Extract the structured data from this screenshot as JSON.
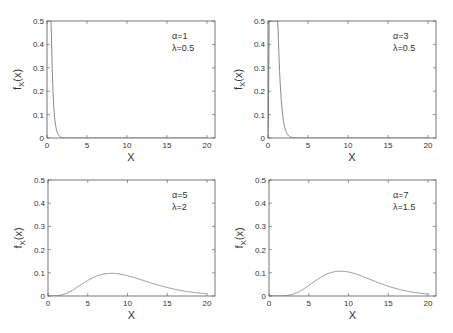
{
  "chart_data": [
    {
      "type": "line",
      "title": "",
      "xlabel": "X",
      "ylabel": "f_X(x)",
      "xlim": [
        0,
        21
      ],
      "ylim": [
        0,
        0.5
      ],
      "xticks": [
        0,
        5,
        10,
        15,
        20
      ],
      "yticks": [
        0,
        0.1,
        0.2,
        0.3,
        0.4,
        0.5
      ],
      "ytick_labels": [
        "0",
        "0.1",
        "0.2",
        "0.3",
        "0.4",
        "0.5"
      ],
      "grid": false,
      "annotation": [
        "α=1",
        "λ=0.5"
      ],
      "params": {
        "alpha": 1,
        "lambda": 0.5
      },
      "series": [
        {
          "name": "pdf",
          "x": [
            0.5,
            0.75,
            1,
            1.5,
            2,
            2.5,
            3,
            3.5,
            4,
            5,
            10,
            20
          ],
          "values": [
            0.5,
            0.37,
            0.25,
            0.12,
            0.06,
            0.03,
            0.012,
            0.005,
            0.002,
            0.0,
            0.0,
            0.0
          ]
        }
      ]
    },
    {
      "type": "line",
      "title": "",
      "xlabel": "X",
      "ylabel": "f_X(x)",
      "xlim": [
        0,
        21
      ],
      "ylim": [
        0,
        0.5
      ],
      "xticks": [
        0,
        5,
        10,
        15,
        20
      ],
      "yticks": [
        0,
        0.1,
        0.2,
        0.3,
        0.4,
        0.5
      ],
      "ytick_labels": [
        "0",
        "0.1",
        "0.2",
        "0.3",
        "0.4",
        "0.5"
      ],
      "grid": false,
      "annotation": [
        "α=3",
        "λ=0.5"
      ],
      "params": {
        "alpha": 3,
        "lambda": 0.5
      },
      "series": [
        {
          "name": "pdf",
          "x": [
            0,
            0.1,
            0.3,
            0.5,
            1.4,
            2,
            2.5,
            3,
            3.5,
            4,
            4.5,
            5,
            6,
            10,
            20
          ],
          "values": [
            0,
            0.2,
            0.5,
            0.5,
            0.5,
            0.33,
            0.22,
            0.14,
            0.08,
            0.045,
            0.022,
            0.01,
            0.0,
            0.0,
            0.0
          ]
        }
      ]
    },
    {
      "type": "line",
      "title": "",
      "xlabel": "X",
      "ylabel": "f_X(x)",
      "xlim": [
        0,
        21
      ],
      "ylim": [
        0,
        0.5
      ],
      "xticks": [
        0,
        5,
        10,
        15,
        20
      ],
      "yticks": [
        0,
        0.1,
        0.2,
        0.3,
        0.4,
        0.5
      ],
      "ytick_labels": [
        "0",
        "0.1",
        "0.2",
        "0.3",
        "0.4",
        "0.5"
      ],
      "grid": false,
      "annotation": [
        "α=5",
        "λ=2"
      ],
      "params": {
        "alpha": 5,
        "lambda": 2
      },
      "series": [
        {
          "name": "pdf",
          "x": [
            0,
            1,
            2,
            3,
            4,
            5,
            6,
            7,
            8,
            9,
            10,
            12,
            14,
            16,
            18,
            20
          ],
          "values": [
            0,
            0.001,
            0.008,
            0.025,
            0.045,
            0.065,
            0.082,
            0.095,
            0.1,
            0.098,
            0.09,
            0.07,
            0.05,
            0.033,
            0.02,
            0.012
          ]
        }
      ]
    },
    {
      "type": "line",
      "title": "",
      "xlabel": "X",
      "ylabel": "f_X(x)",
      "xlim": [
        0,
        21
      ],
      "ylim": [
        0,
        0.5
      ],
      "xticks": [
        0,
        5,
        10,
        15,
        20
      ],
      "yticks": [
        0,
        0.1,
        0.2,
        0.3,
        0.4,
        0.5
      ],
      "ytick_labels": [
        "0",
        "0.1",
        "0.2",
        "0.3",
        "0.4",
        "0.5"
      ],
      "grid": false,
      "annotation": [
        "α=7",
        "λ=1.5"
      ],
      "params": {
        "alpha": 7,
        "lambda": 1.5
      },
      "series": [
        {
          "name": "pdf",
          "x": [
            0,
            2,
            3,
            4,
            5,
            6,
            7,
            8,
            9,
            10,
            11,
            12,
            14,
            16,
            18,
            20
          ],
          "values": [
            0,
            0.0,
            0.003,
            0.012,
            0.03,
            0.055,
            0.08,
            0.1,
            0.107,
            0.103,
            0.093,
            0.08,
            0.055,
            0.032,
            0.017,
            0.008
          ]
        }
      ]
    }
  ],
  "panels": [
    {
      "ann1": "α=1",
      "ann2": "λ=0.5",
      "xlabel": "X",
      "ylabel_main": "f",
      "ylabel_sub": "X",
      "ylabel_arg": "(x)"
    },
    {
      "ann1": "α=3",
      "ann2": "λ=0.5",
      "xlabel": "X",
      "ylabel_main": "f",
      "ylabel_sub": "X",
      "ylabel_arg": "(x)"
    },
    {
      "ann1": "α=5",
      "ann2": "λ=2",
      "xlabel": "X",
      "ylabel_main": "f",
      "ylabel_sub": "X",
      "ylabel_arg": "(x)"
    },
    {
      "ann1": "α=7",
      "ann2": "λ=1.5",
      "xlabel": "X",
      "ylabel_main": "f",
      "ylabel_sub": "X",
      "ylabel_arg": "(x)"
    }
  ],
  "colors": {
    "axis": "#555555",
    "curve": "#8a8a8a",
    "text": "#333333"
  }
}
